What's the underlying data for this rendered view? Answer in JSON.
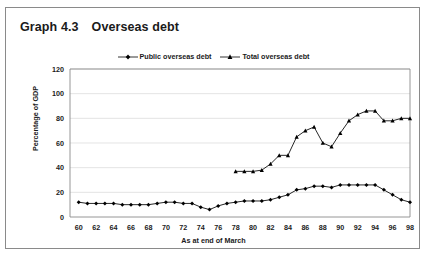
{
  "figure": {
    "label_number": "Graph 4.3",
    "title": "Overseas debt"
  },
  "chart_data": {
    "type": "line",
    "title": "Overseas debt",
    "xlabel": "As at end of March",
    "ylabel": "Percentage of GDP",
    "ylim": [
      0,
      120
    ],
    "ytick_labels": [
      "0",
      "20",
      "40",
      "60",
      "80",
      "100",
      "120"
    ],
    "yticks": [
      0,
      20,
      40,
      60,
      80,
      100,
      120
    ],
    "xlim": [
      59,
      98
    ],
    "xticks": [
      60,
      62,
      64,
      66,
      68,
      70,
      72,
      74,
      76,
      78,
      80,
      82,
      84,
      86,
      88,
      90,
      92,
      94,
      96,
      98
    ],
    "xtick_labels": [
      "60",
      "62",
      "64",
      "66",
      "68",
      "70",
      "72",
      "74",
      "76",
      "78",
      "80",
      "82",
      "84",
      "86",
      "88",
      "90",
      "92",
      "94",
      "96",
      "98"
    ],
    "grid": "horizontal",
    "legend_position": "top-center",
    "series": [
      {
        "name": "Public overseas debt",
        "marker": "diamond",
        "color": "#000000",
        "x": [
          60,
          61,
          62,
          63,
          64,
          65,
          66,
          67,
          68,
          69,
          70,
          71,
          72,
          73,
          74,
          75,
          76,
          77,
          78,
          79,
          80,
          81,
          82,
          83,
          84,
          85,
          86,
          87,
          88,
          89,
          90,
          91,
          92,
          93,
          94,
          95,
          96,
          97,
          98
        ],
        "values": [
          12,
          11,
          11,
          11,
          11,
          10,
          10,
          10,
          10,
          11,
          12,
          12,
          11,
          11,
          8,
          6,
          9,
          11,
          12,
          13,
          13,
          13,
          14,
          16,
          18,
          22,
          23,
          25,
          25,
          24,
          26,
          26,
          26,
          26,
          26,
          22,
          18,
          14,
          12
        ]
      },
      {
        "name": "Total overseas debt",
        "marker": "triangle",
        "color": "#000000",
        "x": [
          78,
          79,
          80,
          81,
          82,
          83,
          84,
          85,
          86,
          87,
          88,
          89,
          90,
          91,
          92,
          93,
          94,
          95,
          96,
          97,
          98
        ],
        "values": [
          37,
          37,
          37,
          38,
          43,
          50,
          50,
          65,
          70,
          73,
          60,
          57,
          68,
          78,
          83,
          86,
          86,
          78,
          78,
          80,
          80
        ]
      }
    ]
  }
}
